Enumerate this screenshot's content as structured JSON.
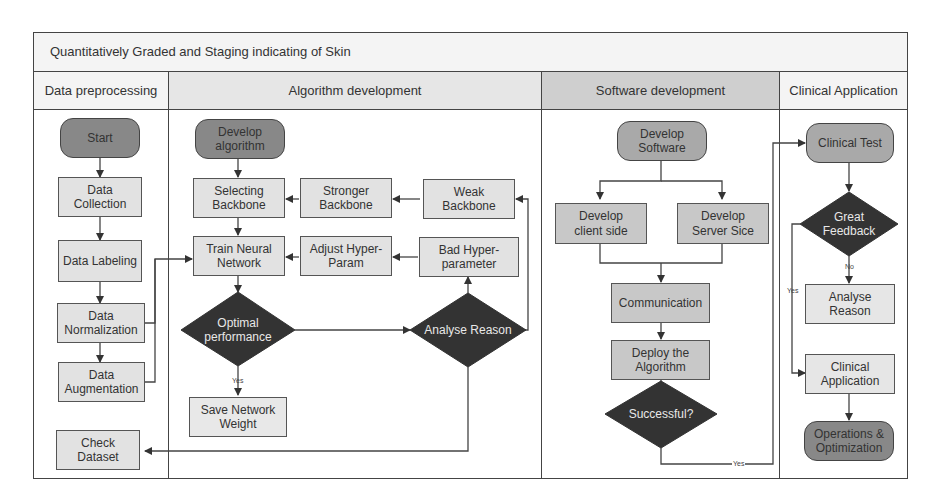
{
  "title": "Quantitatively Graded and Staging indicating of Skin",
  "lanes": [
    {
      "label": "Data preprocessing"
    },
    {
      "label": "Algorithm development"
    },
    {
      "label": "Software development"
    },
    {
      "label": "Clinical Application"
    }
  ],
  "data_preprocessing": {
    "start": "Start",
    "collection": "Data Collection",
    "labeling": "Data Labeling",
    "normalization": "Data Normalization",
    "augmentation": "Data Augmentation",
    "check": "Check Dataset"
  },
  "algorithm": {
    "develop": "Develop algorithm",
    "selecting": "Selecting Backbone",
    "stronger": "Stronger Backbone",
    "weak": "Weak Backbone",
    "train": "Train Neural Network",
    "adjust": "Adjust Hyper-Param",
    "bad": "Bad Hyper-parameter",
    "optimal": "Optimal performance",
    "analyse": "Analyse Reason",
    "yes": "Yes",
    "save": "Save Network Weight"
  },
  "software": {
    "develop": "Develop Software",
    "client": "Develop client side",
    "server": "Develop Server Sice",
    "communication": "Communication",
    "deploy": "Deploy the Algorithm",
    "successful": "Successful?",
    "yes": "Yes"
  },
  "clinical": {
    "test": "Clinical Test",
    "feedback": "Great Feedback",
    "no": "No",
    "yes": "Yes",
    "analyse": "Analyse Reason",
    "application": "Clinical Application",
    "operations": "Operations & Optimization"
  },
  "colors": {
    "terminal": "#888888",
    "process": "#e2e2e2",
    "process_dark": "#c8c8c8",
    "decision": "#333333",
    "lane_header_gray": "#cfcfcf"
  }
}
